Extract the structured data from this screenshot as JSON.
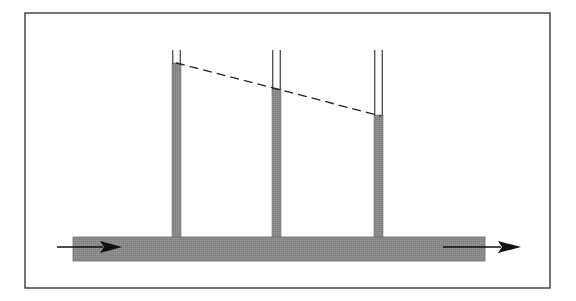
{
  "figure": {
    "caption": "",
    "background_color": "#ffffff",
    "canvas": {
      "width": 576,
      "height": 301
    }
  },
  "frame": {
    "name": "figure-border",
    "x": 25,
    "y": 13,
    "width": 525,
    "height": 275,
    "stroke_color": "#3a3a3a",
    "stroke_width": 1.4,
    "fill": "none"
  },
  "colors": {
    "fluid_gray": "#8a8a8a",
    "fluid_gray_dark": "#7d7d7d",
    "outline": "#4a4a4a",
    "line_black": "#111111",
    "frame": "#3a3a3a",
    "white": "#ffffff"
  },
  "pipe": {
    "name": "horizontal-pipe",
    "label": "Horizontal pipe",
    "x": 73,
    "y": 237,
    "width": 412,
    "height": 24,
    "fill": "#8a8a8a",
    "stroke": "#6f6f6f"
  },
  "tubes": [
    {
      "id": "tube-1",
      "label": "Piezometer tube 1",
      "center_x": 176.5,
      "outer_left": 172,
      "outer_right": 181,
      "width": 9,
      "wall_thickness": 1.4,
      "top_y": 50,
      "bottom_y": 239,
      "fluid_level_y": 63,
      "fluid_column_height": 176,
      "fluid_fill": "#8a8a8a"
    },
    {
      "id": "tube-2",
      "label": "Piezometer tube 2",
      "center_x": 276.5,
      "outer_left": 272,
      "outer_right": 281,
      "width": 9,
      "wall_thickness": 1.4,
      "top_y": 50,
      "bottom_y": 239,
      "fluid_level_y": 89,
      "fluid_column_height": 150,
      "fluid_fill": "#8a8a8a"
    },
    {
      "id": "tube-3",
      "label": "Piezometer tube 3",
      "center_x": 378.5,
      "outer_left": 374,
      "outer_right": 383,
      "width": 9,
      "wall_thickness": 1.4,
      "top_y": 50,
      "bottom_y": 239,
      "fluid_level_y": 115,
      "fluid_column_height": 124,
      "fluid_fill": "#8a8a8a"
    }
  ],
  "grade_line": {
    "name": "hydraulic-grade-line",
    "label": "Hydraulic grade line",
    "style": "dashed",
    "dash_pattern": "9 5",
    "stroke": "#222222",
    "stroke_width": 1.3,
    "points": [
      {
        "x": 176,
        "y": 63
      },
      {
        "x": 277,
        "y": 89
      },
      {
        "x": 381,
        "y": 116
      }
    ]
  },
  "flow_arrows": [
    {
      "id": "inlet-flow-arrow",
      "label": "Inlet flow direction",
      "direction": "right",
      "tail_x": 57,
      "tip_x": 122,
      "y": 247,
      "head_length": 22,
      "head_half_height": 6,
      "stroke": "#111111",
      "stroke_width": 1.4
    },
    {
      "id": "outlet-flow-arrow",
      "label": "Outlet flow direction",
      "direction": "right",
      "tail_x": 443,
      "tip_x": 521,
      "y": 247,
      "head_length": 23,
      "head_half_height": 6,
      "stroke": "#111111",
      "stroke_width": 1.4
    }
  ],
  "chart_data": {
    "type": "line",
    "xlabel": "Position along pipe (px)",
    "ylabel": "Piezometric head (px above pipe centerline)",
    "categories": [
      "Tube 1",
      "Tube 2",
      "Tube 3"
    ],
    "x": [
      176,
      277,
      381
    ],
    "values": [
      186,
      160,
      133
    ],
    "series": [
      {
        "name": "Piezometric head",
        "values": [
          186,
          160,
          133
        ]
      }
    ],
    "annotations": [
      "Head decreases linearly from tube 1 to tube 3 due to friction loss",
      "Flow direction is left to right"
    ],
    "grid": false,
    "legend": "none",
    "xlim": [
      73,
      485
    ],
    "ylim": [
      0,
      200
    ]
  }
}
